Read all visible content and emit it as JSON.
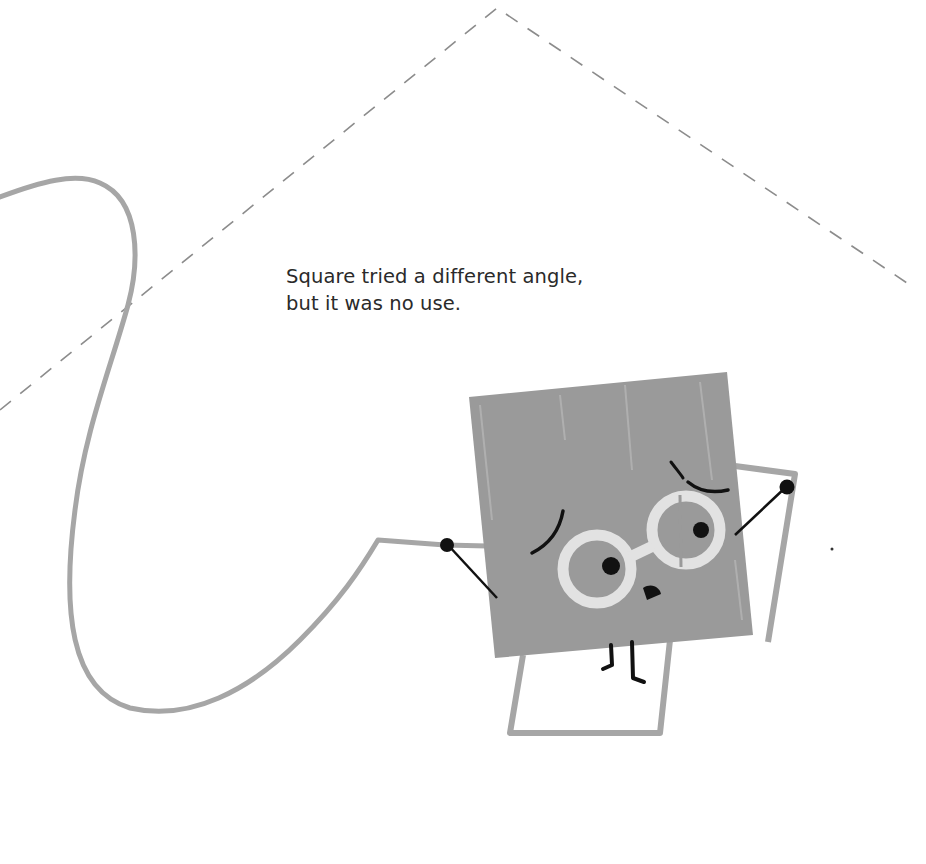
{
  "page": {
    "caption": {
      "line1": "Square tried a different angle,",
      "line2": "but it was no use."
    },
    "illustration": {
      "character": "Square",
      "elements": [
        "dashed-triangle-outline",
        "squiggly-rope-line",
        "square-character-with-glasses",
        "frame-outline"
      ]
    },
    "colors": {
      "background": "#ffffff",
      "square_fill": "#9a9a9a",
      "line_gray": "#a6a6a6",
      "dash_gray": "#8c8c8c",
      "glasses": "#e2e2e2",
      "ink": "#111111",
      "text": "#2a2a2a"
    }
  }
}
